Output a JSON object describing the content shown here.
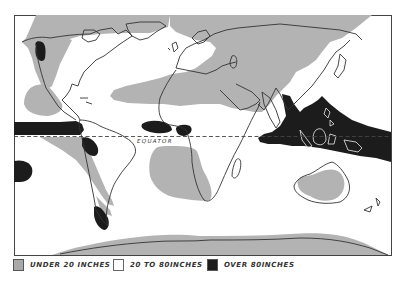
{
  "map": {
    "subject": "Annual rainfall of the world",
    "equator_label": "EQUATOR",
    "colors": {
      "under_20": "#b3b3b3",
      "from_20_to_80": "#ffffff",
      "over_80": "#1c1c1c",
      "coastline": "#333333",
      "border": "#444444"
    }
  },
  "legend": {
    "items": [
      {
        "swatch": "gray",
        "label": "UNDER 20 INCHES"
      },
      {
        "swatch": "white",
        "label": "20 TO 80INCHES"
      },
      {
        "swatch": "black",
        "label": "OVER 80INCHES"
      }
    ]
  }
}
